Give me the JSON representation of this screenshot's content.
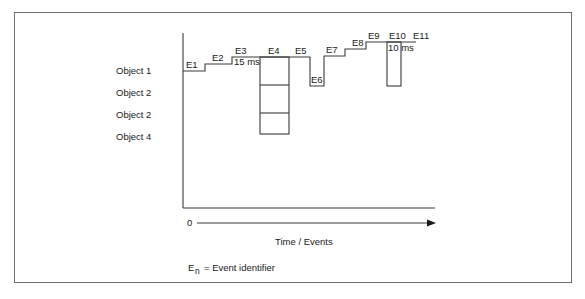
{
  "diagram": {
    "objects": [
      "Object 1",
      "Object 2",
      "Object 2",
      "Object 4"
    ],
    "events": {
      "e1": "E1",
      "e2": "E2",
      "e3": "E3",
      "e4": "E4",
      "e5": "E5",
      "e6": "E6",
      "e7": "E7",
      "e8": "E8",
      "e9": "E9",
      "e10": "E10",
      "e11": "E11"
    },
    "durations": {
      "e3": "15 ms",
      "e10": "10 ms"
    },
    "axis": {
      "origin": "0",
      "x_title": "Time / Events"
    },
    "legend": {
      "symbol_base": "E",
      "symbol_sub": "n",
      "text": "= Event identifier"
    },
    "colors": {
      "line": "#3a3a3a",
      "frame": "#6e6e6e",
      "text": "#1a1a1a"
    }
  }
}
